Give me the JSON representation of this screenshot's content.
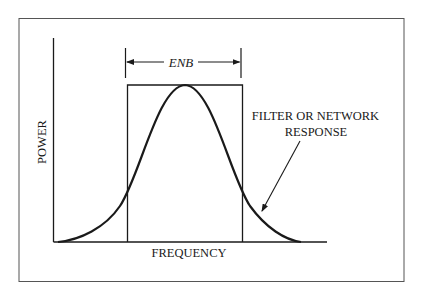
{
  "diagram": {
    "type": "filter-response-vs-equivalent-noise-bandwidth",
    "y_axis_label": "POWER",
    "x_axis_label": "FREQUENCY",
    "bandwidth_label": "ENB",
    "curve_label_line1": "FILTER OR NETWORK",
    "curve_label_line2": "RESPONSE",
    "colors": {
      "ink": "#1a1a1a",
      "frame": "#555555",
      "background": "#ffffff"
    }
  }
}
